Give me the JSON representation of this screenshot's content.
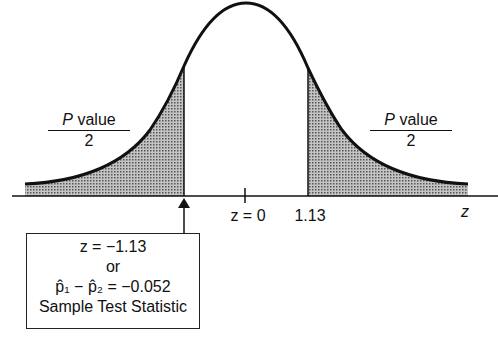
{
  "diagram": {
    "type": "normal-distribution-two-tailed-test",
    "left_tail_label": {
      "numerator_italic": "P",
      "numerator_rest": " value",
      "denominator": "2"
    },
    "right_tail_label": {
      "numerator_italic": "P",
      "numerator_rest": " value",
      "denominator": "2"
    },
    "axis_label": "z",
    "tick_center_label": "z = 0",
    "tick_right_label": "1.13",
    "critical_left": -1.13,
    "critical_right": 1.13,
    "shade_color": "#9a9a9a",
    "box": {
      "line1": "z = −1.13",
      "line2": "or",
      "line3": "p̂₁ − p̂₂ = −0.052",
      "line4": "Sample Test Statistic"
    }
  }
}
